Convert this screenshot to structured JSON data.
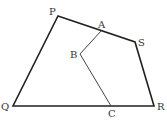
{
  "diagram": {
    "type": "quadrilateral",
    "points": {
      "P": {
        "label": "P",
        "x": 58,
        "y": 16
      },
      "Q": {
        "label": "Q",
        "x": 13,
        "y": 106
      },
      "R": {
        "label": "R",
        "x": 154,
        "y": 106
      },
      "S": {
        "label": "S",
        "x": 135,
        "y": 42
      },
      "A": {
        "label": "A",
        "x": 101,
        "y": 31
      },
      "B": {
        "label": "B",
        "x": 80,
        "y": 54
      },
      "C": {
        "label": "C",
        "x": 111,
        "y": 106
      }
    },
    "polygon": [
      "P",
      "S",
      "R",
      "Q"
    ],
    "path": [
      "A",
      "B",
      "C"
    ],
    "colors": {
      "outline": "#222222",
      "path": "#444444",
      "label": "#333333"
    }
  }
}
